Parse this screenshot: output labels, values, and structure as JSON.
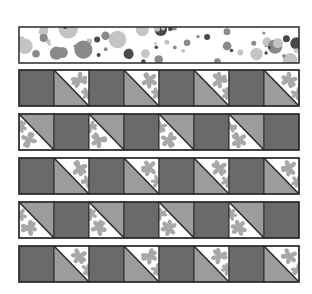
{
  "diagram": {
    "colors": {
      "background": "#ffffff",
      "outline": "#2a2a2a",
      "dark_square": "#6a6a6a",
      "medium_triangle": "#9c9c9c",
      "floral_background": "#ffffff",
      "floral_motif": "#a8a8a8",
      "dot_dark": "#4a4a4a",
      "dot_medium": "#8a8a8a",
      "dot_light": "#c4c4c4"
    },
    "layout": {
      "left": 19,
      "tile": 35,
      "columns": 8,
      "border_strip": {
        "y": 27,
        "height": 36
      },
      "row_tops": [
        70,
        114,
        158,
        202,
        246
      ],
      "row_height": 36
    },
    "border_strip": {
      "name": "polka-dot-border",
      "fabric": "polka dots"
    },
    "rows": [
      {
        "name": "row-1",
        "pattern": [
          "D",
          "HL",
          "D",
          "HL",
          "D",
          "HL",
          "D",
          "HL"
        ]
      },
      {
        "name": "row-2",
        "pattern": [
          "HU",
          "D",
          "HU",
          "D",
          "HU",
          "D",
          "HU",
          "D"
        ]
      },
      {
        "name": "row-3",
        "pattern": [
          "D",
          "HL",
          "D",
          "HL",
          "D",
          "HL",
          "D",
          "HL"
        ]
      },
      {
        "name": "row-4",
        "pattern": [
          "HU",
          "D",
          "HU",
          "D",
          "HU",
          "D",
          "HU",
          "D"
        ]
      },
      {
        "name": "row-5",
        "pattern": [
          "D",
          "HL",
          "D",
          "HL",
          "D",
          "HL",
          "D",
          "HL"
        ]
      }
    ],
    "legend": {
      "D": "solid dark square",
      "HL": "half-square triangle, medium gray lower-left, floral upper-right",
      "HU": "half-square triangle, medium gray upper-right, floral lower-left"
    }
  }
}
